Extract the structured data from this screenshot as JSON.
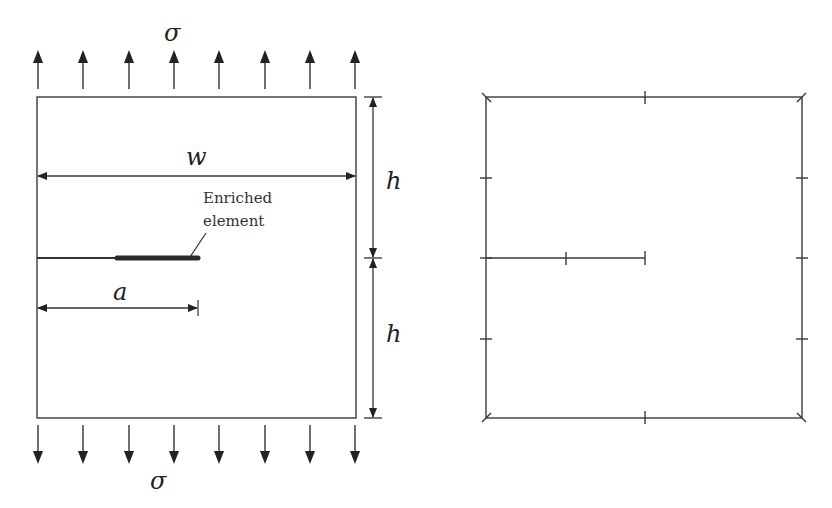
{
  "figure": {
    "left_panel": {
      "name": "cracked-plate-geometry",
      "load_label_top": "σ",
      "load_label_bottom": "σ",
      "width_label": "w",
      "crack_length_label": "a",
      "half_height_label_upper": "h",
      "half_height_label_lower": "h",
      "annotation_line1": "Enriched",
      "annotation_line2": "element",
      "load_arrows_count": 8
    },
    "right_panel": {
      "name": "boundary-discretization-mesh",
      "description": "Square boundary with tick marks at node positions and an internal crack segment"
    },
    "colors": {
      "line": "#3a3a3a",
      "background": "#ffffff"
    }
  }
}
